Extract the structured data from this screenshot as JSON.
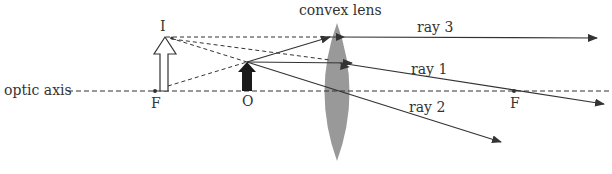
{
  "diagram": {
    "labels": {
      "optic_axis": "optic axis",
      "lens": "convex lens",
      "image": "I",
      "object": "O",
      "focal_left": "F",
      "focal_right": "F",
      "ray1": "ray 1",
      "ray2": "ray 2",
      "ray3": "ray 3"
    },
    "colors": {
      "lens": "#999999",
      "line": "#333333",
      "object": "#1a1a1a",
      "image_fill": "#ffffff"
    }
  }
}
